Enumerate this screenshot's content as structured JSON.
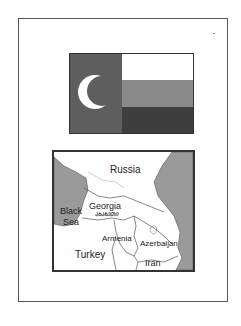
{
  "flag": {
    "colors": {
      "hoist": "#5e5e5e",
      "crescent": "#ffffff",
      "stripe_top": "#ffffff",
      "stripe_middle": "#8a8a8a",
      "stripe_bottom": "#3e3e3e"
    }
  },
  "map": {
    "labels": {
      "russia": "Russia",
      "georgia": "Georgia",
      "black_sea_1": "Black",
      "black_sea_2": "Sea",
      "armenia": "Armenia",
      "azerbaijan": "Azerbaijan",
      "turkey": "Turkey",
      "iran": "Iran",
      "region_script": "ᲐᲮᲐᲖᲔᲗᲘ"
    },
    "colors": {
      "water": "#9a9a9a",
      "land": "#ffffff",
      "border": "#444444"
    }
  }
}
